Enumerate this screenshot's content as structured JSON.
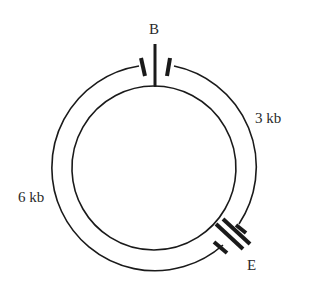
{
  "diagram": {
    "type": "plasmid restriction map",
    "sites": [
      {
        "id": "B",
        "label": "B"
      },
      {
        "id": "E",
        "label": "E"
      }
    ],
    "segments": [
      {
        "from": "B",
        "to": "E",
        "side": "right",
        "label": "3 kb"
      },
      {
        "from": "E",
        "to": "B",
        "side": "left",
        "label": "6 kb"
      }
    ],
    "colors": {
      "stroke": "#1a1a1a",
      "background": "#ffffff"
    }
  }
}
